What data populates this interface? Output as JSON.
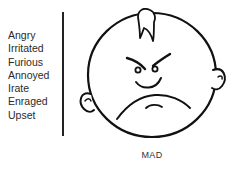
{
  "synonyms": [
    "Angry",
    "Irritated",
    "Furious",
    "Annoyed",
    "Irate",
    "Enraged",
    "Upset"
  ],
  "face": {
    "icon": "mad-face-icon",
    "expression": "mad",
    "stroke_color": "#111111"
  },
  "caption": "MAD"
}
